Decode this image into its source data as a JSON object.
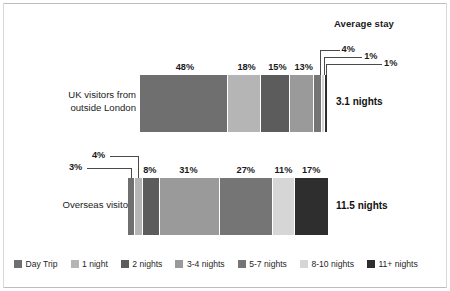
{
  "header": {
    "average_stay_title": "Average stay"
  },
  "legend": {
    "items": [
      {
        "label": "Day Trip",
        "color": "#6f6f6f"
      },
      {
        "label": "1 night",
        "color": "#b5b5b5"
      },
      {
        "label": "2 nights",
        "color": "#5c5c5c"
      },
      {
        "label": "3-4 nights",
        "color": "#9a9a9a"
      },
      {
        "label": "5-7 nights",
        "color": "#757575"
      },
      {
        "label": "8-10 nights",
        "color": "#d6d6d6"
      },
      {
        "label": "11+ nights",
        "color": "#2e2e2e"
      }
    ]
  },
  "rows": [
    {
      "id": "uk",
      "label_line1": "UK visitors from",
      "label_line2": "outside London",
      "average_stay": "3.1 nights",
      "values": [
        48,
        18,
        15,
        13,
        4,
        1,
        1
      ],
      "labels": [
        "48%",
        "18%",
        "15%",
        "13%",
        "4%",
        "1%",
        "1%"
      ],
      "callout_labels": [
        "4%",
        "1%",
        "1%"
      ]
    },
    {
      "id": "overseas",
      "label_line1": "Overseas visitors",
      "label_line2": "",
      "average_stay": "11.5 nights",
      "values": [
        3,
        4,
        8,
        31,
        27,
        11,
        17
      ],
      "labels": [
        "3%",
        "4%",
        "8%",
        "31%",
        "27%",
        "11%",
        "17%"
      ],
      "callout_labels": [
        "3%",
        "4%"
      ]
    }
  ],
  "chart_data": {
    "type": "bar",
    "subtype": "stacked-horizontal-100pct",
    "title": "",
    "xlabel": "",
    "ylabel": "",
    "xlim": [
      0,
      100
    ],
    "grid": false,
    "legend_position": "bottom",
    "categories": [
      "UK visitors from outside London",
      "Overseas visitors"
    ],
    "series": [
      {
        "name": "Day Trip",
        "values": [
          48,
          3
        ],
        "color": "#6f6f6f"
      },
      {
        "name": "1 night",
        "values": [
          18,
          4
        ],
        "color": "#b5b5b5"
      },
      {
        "name": "2 nights",
        "values": [
          15,
          8
        ],
        "color": "#5c5c5c"
      },
      {
        "name": "3-4 nights",
        "values": [
          13,
          31
        ],
        "color": "#9a9a9a"
      },
      {
        "name": "5-7 nights",
        "values": [
          4,
          27
        ],
        "color": "#757575"
      },
      {
        "name": "8-10 nights",
        "values": [
          1,
          11
        ],
        "color": "#d6d6d6"
      },
      {
        "name": "11+ nights",
        "values": [
          1,
          17
        ],
        "color": "#2e2e2e"
      }
    ],
    "annotations": {
      "average_stay_title": "Average stay",
      "average_stay_values": [
        "3.1 nights",
        "11.5 nights"
      ]
    }
  }
}
